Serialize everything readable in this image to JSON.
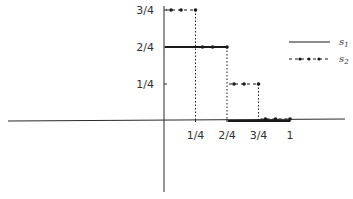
{
  "chart_data": {
    "type": "line",
    "subtype": "step",
    "title": "",
    "xlabel": "",
    "ylabel": "",
    "xlim": [
      -0.75,
      1.05
    ],
    "ylim": [
      -0.4,
      0.88
    ],
    "grid": false,
    "legend_position": "upper-right",
    "x_ticks": [
      {
        "value": 0.25,
        "label": "1/4"
      },
      {
        "value": 0.5,
        "label": "2/4"
      },
      {
        "value": 0.75,
        "label": "3/4"
      },
      {
        "value": 1.0,
        "label": "1"
      }
    ],
    "y_ticks": [
      {
        "value": 0.25,
        "label": "1/4"
      },
      {
        "value": 0.5,
        "label": "2/4"
      },
      {
        "value": 0.75,
        "label": "3/4"
      }
    ],
    "series": [
      {
        "name": "s1",
        "label": "s",
        "subscript": "1",
        "style": "solid",
        "color": "#1a1a1a",
        "steps": [
          {
            "x_start": 0.0,
            "x_end": 0.5,
            "y": 0.5
          },
          {
            "x_start": 0.5,
            "x_end": 1.0,
            "y": 0.0
          }
        ]
      },
      {
        "name": "s2",
        "label": "s",
        "subscript": "2",
        "style": "dash-dot-marker",
        "color": "#1a1a1a",
        "steps": [
          {
            "x_start": 0.0,
            "x_end": 0.25,
            "y": 0.75
          },
          {
            "x_start": 0.25,
            "x_end": 0.5,
            "y": 0.5
          },
          {
            "x_start": 0.5,
            "x_end": 0.75,
            "y": 0.25
          },
          {
            "x_start": 0.75,
            "x_end": 1.0,
            "y": 0.0
          }
        ]
      }
    ]
  }
}
